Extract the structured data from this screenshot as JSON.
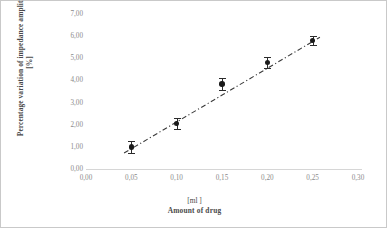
{
  "chart_data": {
    "type": "scatter",
    "title": "",
    "xlabel": "Amount of drug",
    "x_unit": "[ml ]",
    "ylabel": "Percentage variation of impedance amplitude [%]",
    "xlim": [
      0.0,
      0.3
    ],
    "ylim": [
      0.0,
      7.0
    ],
    "grid": false,
    "legend": "none",
    "x_tick_labels": [
      "0,00",
      "0,05",
      "0,10",
      "0,15",
      "0,20",
      "0,25",
      "0,30"
    ],
    "x_tick_values": [
      0.0,
      0.05,
      0.1,
      0.15,
      0.2,
      0.25,
      0.3
    ],
    "y_tick_labels": [
      "0,00",
      "1,00",
      "2,00",
      "3,00",
      "4,00",
      "5,00",
      "6,00",
      "7,00"
    ],
    "y_tick_values": [
      0,
      1,
      2,
      3,
      4,
      5,
      6,
      7
    ],
    "x": [
      0.05,
      0.1,
      0.15,
      0.2,
      0.25
    ],
    "values": [
      1.0,
      2.05,
      3.85,
      4.8,
      5.8
    ],
    "yerr": [
      0.28,
      0.25,
      0.28,
      0.25,
      0.22
    ],
    "series": [
      {
        "name": "Percentage variation of impedance amplitude",
        "x": [
          0.05,
          0.1,
          0.15,
          0.2,
          0.25
        ],
        "values": [
          1.0,
          2.05,
          3.85,
          4.8,
          5.8
        ],
        "yerr": [
          0.28,
          0.25,
          0.28,
          0.25,
          0.22
        ],
        "marker": "filled-circle",
        "marker_color": "#1a1a1a"
      }
    ],
    "trendline": {
      "style": "dash-dot",
      "color": "#3a3a3a",
      "x_start": 0.042,
      "y_start": 0.72,
      "x_end": 0.258,
      "y_end": 5.95
    },
    "colors": {
      "marker": "#1a1a1a",
      "error_bar": "#2b2b2b",
      "trendline": "#3a3a3a",
      "axis": "#d6d6d6",
      "tick_text": "#8a8a8a",
      "title_text": "#4a4a4a",
      "background": "#ffffff"
    }
  }
}
